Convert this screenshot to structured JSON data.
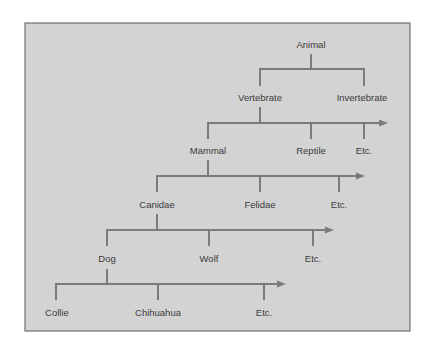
{
  "diagram": {
    "colors": {
      "background": "#d3d3d3",
      "frame": "#6f6f6f",
      "line": "#7b7b7b",
      "text": "#3b3b3b"
    },
    "frame": {
      "x": 25,
      "y": 23,
      "width": 385,
      "height": 308
    },
    "nodes": [
      {
        "id": "animal",
        "label": "Animal",
        "x": 311,
        "y": 44
      },
      {
        "id": "vertebrate",
        "label": "Vertebrate",
        "x": 260,
        "y": 97
      },
      {
        "id": "invertebrate",
        "label": "Invertebrate",
        "x": 362,
        "y": 97
      },
      {
        "id": "mammal",
        "label": "Mammal",
        "x": 208,
        "y": 150
      },
      {
        "id": "reptile",
        "label": "Reptile",
        "x": 311,
        "y": 150
      },
      {
        "id": "etc-1",
        "label": "Etc.",
        "x": 364,
        "y": 150
      },
      {
        "id": "canidae",
        "label": "Canidae",
        "x": 157,
        "y": 204
      },
      {
        "id": "felidae",
        "label": "Felidae",
        "x": 260,
        "y": 204
      },
      {
        "id": "etc-2",
        "label": "Etc.",
        "x": 339,
        "y": 204
      },
      {
        "id": "dog",
        "label": "Dog",
        "x": 107,
        "y": 258
      },
      {
        "id": "wolf",
        "label": "Wolf",
        "x": 209,
        "y": 258
      },
      {
        "id": "etc-3",
        "label": "Etc.",
        "x": 313,
        "y": 258
      },
      {
        "id": "collie",
        "label": "Collie",
        "x": 57,
        "y": 312
      },
      {
        "id": "chihuahua",
        "label": "Chihuahua",
        "x": 158,
        "y": 312
      },
      {
        "id": "etc-4",
        "label": "Etc.",
        "x": 264,
        "y": 312
      }
    ],
    "branches": [
      {
        "parent": "animal",
        "parent_x": 311,
        "stem_top": 55,
        "bar_y": 69,
        "bar_start": 260,
        "bar_end": 364,
        "arrow": false,
        "children_x": [
          260,
          364
        ],
        "drop_bottom": 85
      },
      {
        "parent": "vertebrate",
        "parent_x": 260,
        "stem_top": 108,
        "bar_y": 123,
        "bar_start": 208,
        "bar_end": 388,
        "arrow": true,
        "children_x": [
          208,
          311,
          364
        ],
        "drop_bottom": 138
      },
      {
        "parent": "mammal",
        "parent_x": 208,
        "stem_top": 161,
        "bar_y": 176,
        "bar_start": 157,
        "bar_end": 365,
        "arrow": true,
        "children_x": [
          157,
          260,
          339
        ],
        "drop_bottom": 191
      },
      {
        "parent": "canidae",
        "parent_x": 157,
        "stem_top": 215,
        "bar_y": 230,
        "bar_start": 107,
        "bar_end": 334,
        "arrow": true,
        "children_x": [
          107,
          209,
          313
        ],
        "drop_bottom": 245
      },
      {
        "parent": "dog",
        "parent_x": 107,
        "stem_top": 270,
        "bar_y": 284,
        "bar_start": 56,
        "bar_end": 286,
        "arrow": true,
        "children_x": [
          56,
          158,
          264
        ],
        "drop_bottom": 299
      }
    ]
  }
}
